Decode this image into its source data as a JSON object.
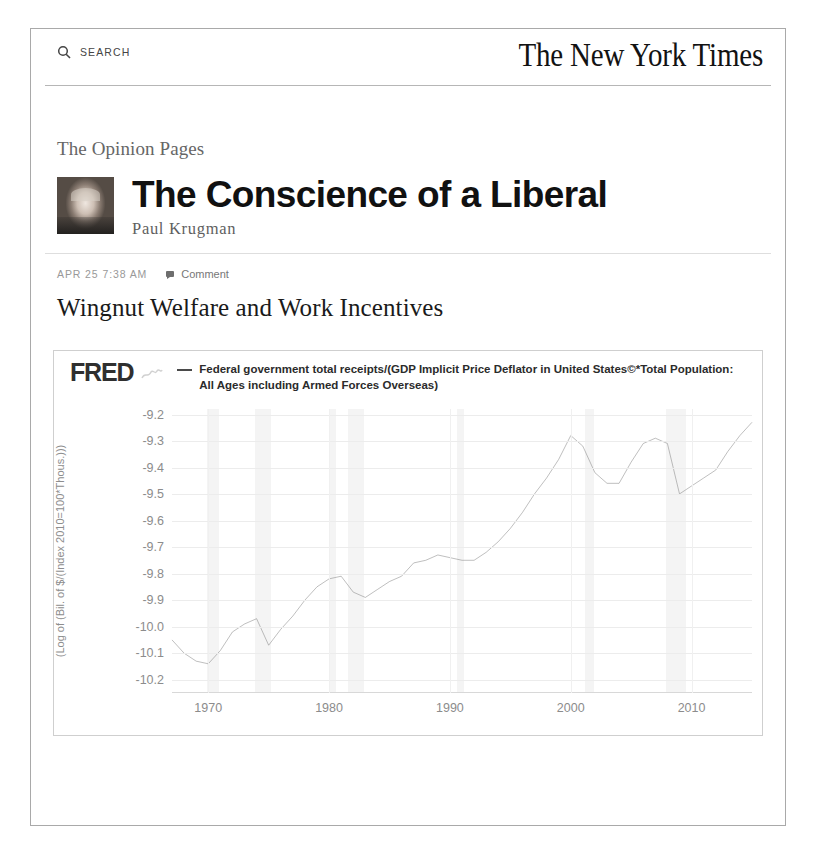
{
  "masthead": {
    "search_label": "SEARCH",
    "brand": "The New York Times"
  },
  "blog": {
    "kicker": "The Opinion Pages",
    "title": "The Conscience of a Liberal",
    "author": "Paul Krugman"
  },
  "post": {
    "timestamp": "APR 25 7:38 AM",
    "comment_label": "Comment",
    "title": "Wingnut Welfare and Work Incentives"
  },
  "chart_data": {
    "type": "line",
    "brand": "FRED",
    "title": "",
    "legend": [
      "Federal government total receipts/(GDP Implicit Price Deflator in United States©*Total Population: All Ages including Armed Forces Overseas)"
    ],
    "legend_position": "top",
    "grid": true,
    "xlabel": "",
    "ylabel": "(Log of (Bil. of $/(Index 2010=100*Thous.)))",
    "xlim": [
      1967,
      2015
    ],
    "ylim": [
      -10.25,
      -9.18
    ],
    "yticks": [
      -9.2,
      -9.3,
      -9.4,
      -9.5,
      -9.6,
      -9.7,
      -9.8,
      -9.9,
      -10.0,
      -10.1,
      -10.2
    ],
    "ytick_labels": [
      "-9.2",
      "-9.3",
      "-9.4",
      "-9.5",
      "-9.6",
      "-9.7",
      "-9.8",
      "-9.9",
      "-10.0",
      "-10.1",
      "-10.2"
    ],
    "xticks": [
      1970,
      1980,
      1990,
      2000,
      2010
    ],
    "xtick_labels": [
      "1970",
      "1980",
      "1990",
      "2000",
      "2010"
    ],
    "line_color": "#6f6f6f",
    "recession_bands": [
      [
        1969.9,
        1970.9
      ],
      [
        1973.9,
        1975.2
      ],
      [
        1980.0,
        1980.6
      ],
      [
        1981.6,
        1982.9
      ],
      [
        1990.6,
        1991.2
      ],
      [
        2001.2,
        2001.9
      ],
      [
        2007.9,
        2009.5
      ]
    ],
    "x": [
      1967,
      1968,
      1969,
      1970,
      1971,
      1972,
      1973,
      1974,
      1975,
      1976,
      1977,
      1978,
      1979,
      1980,
      1981,
      1982,
      1983,
      1984,
      1985,
      1986,
      1987,
      1988,
      1989,
      1990,
      1991,
      1992,
      1993,
      1994,
      1995,
      1996,
      1997,
      1998,
      1999,
      2000,
      2001,
      2002,
      2003,
      2004,
      2005,
      2006,
      2007,
      2008,
      2009,
      2010,
      2011,
      2012,
      2013,
      2014,
      2015
    ],
    "values": [
      -10.05,
      -10.1,
      -10.13,
      -10.14,
      -10.09,
      -10.02,
      -9.99,
      -9.97,
      -10.07,
      -10.01,
      -9.96,
      -9.9,
      -9.85,
      -9.82,
      -9.81,
      -9.87,
      -9.89,
      -9.86,
      -9.83,
      -9.81,
      -9.76,
      -9.75,
      -9.73,
      -9.74,
      -9.75,
      -9.75,
      -9.72,
      -9.68,
      -9.63,
      -9.57,
      -9.5,
      -9.44,
      -9.37,
      -9.28,
      -9.32,
      -9.42,
      -9.46,
      -9.46,
      -9.38,
      -9.31,
      -9.29,
      -9.31,
      -9.5,
      -9.47,
      -9.44,
      -9.41,
      -9.34,
      -9.28,
      -9.23
    ]
  }
}
